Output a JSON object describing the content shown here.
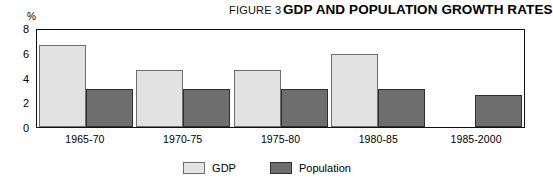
{
  "header": {
    "figure_label": "FIGURE 3",
    "title": "GDP AND POPULATION GROWTH RATES"
  },
  "axis": {
    "unit": "%",
    "ticks": [
      "8",
      "6",
      "4",
      "2",
      "0"
    ]
  },
  "legend": {
    "items": [
      {
        "label": "GDP",
        "color": "#e2e2e2",
        "swatch": "gdp-swatch"
      },
      {
        "label": "Population",
        "color": "#6e6e6e",
        "swatch": "population-swatch"
      }
    ]
  },
  "chart_data": {
    "type": "bar",
    "title": "GDP AND POPULATION GROWTH RATES",
    "xlabel": "",
    "ylabel": "%",
    "ylim": [
      0,
      8
    ],
    "yticks": [
      0,
      2,
      4,
      6,
      8
    ],
    "grid": false,
    "legend_position": "bottom-center",
    "categories": [
      "1965-70",
      "1970-75",
      "1975-80",
      "1980-85",
      "1985-2000"
    ],
    "series": [
      {
        "name": "GDP",
        "color": "#e2e2e2",
        "values": [
          6.8,
          4.7,
          4.7,
          6.0,
          null
        ]
      },
      {
        "name": "Population",
        "color": "#6e6e6e",
        "values": [
          3.1,
          3.1,
          3.1,
          3.1,
          2.6
        ]
      }
    ]
  }
}
